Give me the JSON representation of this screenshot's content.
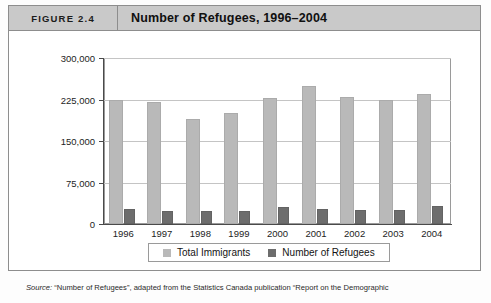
{
  "figure": {
    "tag": "FIGURE 2.4",
    "title": "Number of Refugees, 1996–2004"
  },
  "source": {
    "label": "Source:",
    "text": " “Number of Refugees”, adapted from the Statistics Canada publication “Report on the Demographic"
  },
  "colors": {
    "total_immigrants": "#b9b9b9",
    "number_of_refugees": "#6d6d6d",
    "header_band": "#c9c9c9",
    "frame": "#8d8d8d",
    "gridline": "#c4c4c4"
  },
  "chart_data": {
    "type": "bar",
    "title": "Number of Refugees, 1996–2004",
    "xlabel": "",
    "ylabel": "",
    "categories": [
      "1996",
      "1997",
      "1998",
      "1999",
      "2000",
      "2001",
      "2002",
      "2003",
      "2004"
    ],
    "series": [
      {
        "name": "Total Immigrants",
        "color": "#b9b9b9",
        "values": [
          225000,
          220000,
          190000,
          200000,
          227000,
          250000,
          230000,
          224000,
          235000
        ]
      },
      {
        "name": "Number of Refugees",
        "color": "#6d6d6d",
        "values": [
          28000,
          24000,
          23000,
          24000,
          30000,
          28000,
          25000,
          26000,
          32000
        ]
      }
    ],
    "ylim": [
      0,
      300000
    ],
    "yticks": [
      0,
      75000,
      150000,
      225000,
      300000
    ],
    "ytick_labels": [
      "0",
      "75,000",
      "150,000",
      "225,000",
      "300,000"
    ],
    "grid": true,
    "legend_position": "bottom"
  }
}
